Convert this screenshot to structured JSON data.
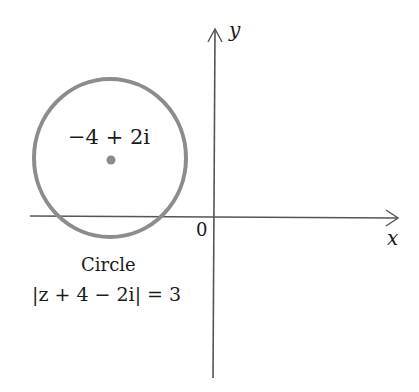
{
  "diagram": {
    "type": "complex-plane-circle",
    "axes": {
      "x_label": "x",
      "y_label": "y",
      "origin_label": "0"
    },
    "circle": {
      "center_label": "−4 + 2i",
      "center": [
        -4,
        2
      ],
      "radius": 3,
      "caption_title": "Circle",
      "caption_equation": "|z + 4 − 2i| = 3",
      "stroke_color": "#8c8c8c"
    },
    "axis_color": "#555555"
  }
}
